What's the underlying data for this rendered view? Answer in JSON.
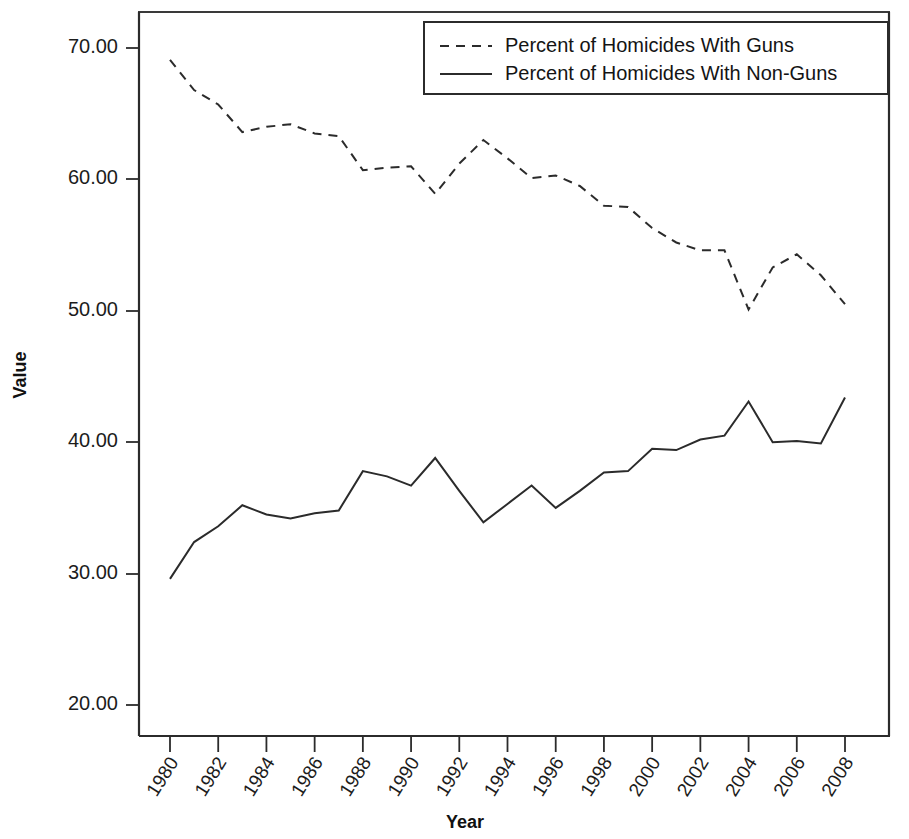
{
  "chart_data": {
    "type": "line",
    "title": "",
    "xlabel": "Year",
    "ylabel": "Value",
    "xlim": [
      1980,
      2008
    ],
    "ylim": [
      20.0,
      70.0
    ],
    "grid": false,
    "legend_position": "top-right",
    "x": [
      1980,
      1981,
      1982,
      1983,
      1984,
      1985,
      1986,
      1987,
      1988,
      1989,
      1990,
      1991,
      1992,
      1993,
      1994,
      1995,
      1996,
      1997,
      1998,
      1999,
      2000,
      2001,
      2002,
      2003,
      2004,
      2005,
      2006,
      2007,
      2008
    ],
    "x_tick_labels": [
      "1980",
      "1982",
      "1984",
      "1986",
      "1988",
      "1990",
      "1992",
      "1994",
      "1996",
      "1998",
      "2000",
      "2002",
      "2004",
      "2006",
      "2008"
    ],
    "y_tick_labels": [
      "70.00",
      "60.00",
      "50.00",
      "40.00",
      "30.00",
      "20.00"
    ],
    "y_ticks": [
      70.0,
      60.0,
      50.0,
      40.0,
      30.0,
      20.0
    ],
    "series": [
      {
        "name": "Percent of Homicides With Guns",
        "style": "dashed",
        "values": [
          69.1,
          66.8,
          65.7,
          63.6,
          64.0,
          64.2,
          63.5,
          63.3,
          60.7,
          60.9,
          61.0,
          58.9,
          61.2,
          63.0,
          61.6,
          60.1,
          60.3,
          59.5,
          58.0,
          57.9,
          56.3,
          55.2,
          54.6,
          54.6,
          50.1,
          53.3,
          54.3,
          52.7,
          50.5
        ]
      },
      {
        "name": "Percent of Homicides With Non-Guns",
        "style": "solid",
        "values": [
          29.6,
          32.4,
          33.6,
          35.2,
          34.5,
          34.2,
          34.6,
          34.8,
          37.8,
          37.4,
          36.7,
          38.8,
          36.3,
          33.9,
          35.3,
          36.7,
          35.0,
          36.3,
          37.7,
          37.8,
          39.5,
          39.4,
          40.2,
          40.5,
          43.1,
          40.0,
          40.1,
          39.9,
          43.4
        ]
      }
    ]
  },
  "legend": {
    "entries": [
      {
        "label": "Percent of Homicides With Guns",
        "style": "dashed"
      },
      {
        "label": "Percent of Homicides With Non-Guns",
        "style": "solid"
      }
    ]
  },
  "axes": {
    "y_title": "Value",
    "x_title": "Year"
  }
}
